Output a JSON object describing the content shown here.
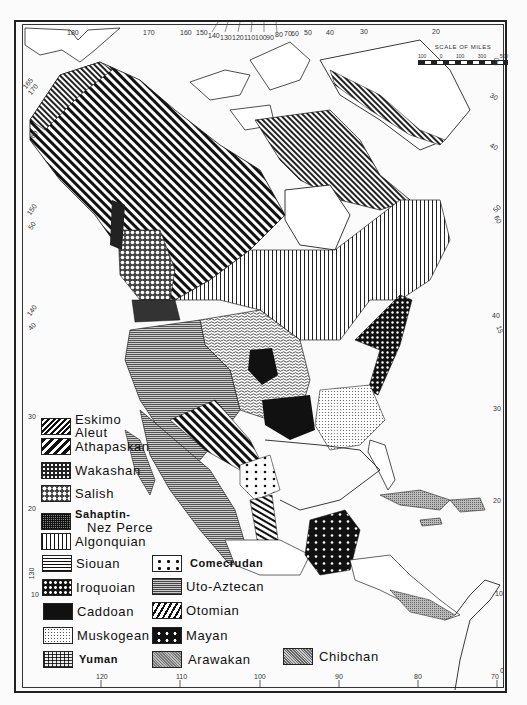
{
  "map": {
    "title": "Native language families of North America",
    "scale": {
      "title": "SCALE OF MILES",
      "ticks": [
        "100",
        "0",
        "100",
        "300",
        "500"
      ]
    },
    "top_longitudes": [
      "180",
      "170",
      "160",
      "150",
      "140",
      "130",
      "120",
      "110",
      "100",
      "90",
      "80",
      "70",
      "60",
      "50",
      "40",
      "30",
      "20"
    ],
    "bottom_longitudes": [
      "120",
      "110",
      "100",
      "90",
      "80",
      "70"
    ],
    "left_labels": [
      "165",
      "170",
      "60",
      "150",
      "50",
      "140",
      "40",
      "30",
      "20",
      "130",
      "10"
    ],
    "right_labels": [
      "60",
      "30",
      "40",
      "50",
      "60",
      "40",
      "15",
      "30",
      "20",
      "10",
      "0"
    ],
    "colors": {
      "ink": "#111111",
      "paper": "#fbfbfb",
      "frame": "#222222"
    }
  },
  "legend": {
    "items": [
      {
        "id": "eskimo-aleut",
        "label_line1": "Eskimo",
        "label_line2": "Aleut",
        "pattern": "fine-diagonal-hatch"
      },
      {
        "id": "athapaskan",
        "label": "Athapaskan",
        "pattern": "bold-diagonal-stripes"
      },
      {
        "id": "wakashan",
        "label": "Wakashan",
        "pattern": "dense-white-dots-on-black"
      },
      {
        "id": "salish",
        "label": "Salish",
        "pattern": "diamond-lattice"
      },
      {
        "id": "sahaptin-nez-perce",
        "label_line1": "Sahaptin-",
        "label_line2": "Nez Perce",
        "pattern": "dense-grid"
      },
      {
        "id": "algonquian",
        "label": "Algonquian",
        "pattern": "vertical-lines"
      },
      {
        "id": "siouan",
        "label": "Siouan",
        "pattern": "wavy-horizontal-lines"
      },
      {
        "id": "iroquoian",
        "label": "Iroquoian",
        "pattern": "white-dots-on-black"
      },
      {
        "id": "caddoan",
        "label": "Caddoan",
        "pattern": "solid-black"
      },
      {
        "id": "muskogean",
        "label": "Muskogean",
        "pattern": "fine-stipple"
      },
      {
        "id": "yuman",
        "label": "Yuman",
        "pattern": "brick-grid"
      },
      {
        "id": "comecrudan",
        "label": "Comecrudan",
        "pattern": "sparse-black-dots"
      },
      {
        "id": "uto-aztecan",
        "label": "Uto-Aztecan",
        "pattern": "horizontal-lines"
      },
      {
        "id": "otomian",
        "label": "Otomian",
        "pattern": "broken-diagonal-stripes"
      },
      {
        "id": "mayan",
        "label": "Mayan",
        "pattern": "large-white-dots-on-black"
      },
      {
        "id": "arawakan",
        "label": "Arawakan",
        "pattern": "grey-fine-hatch"
      },
      {
        "id": "chibchan",
        "label": "Chibchan",
        "pattern": "grey-cross-hatch"
      }
    ]
  }
}
